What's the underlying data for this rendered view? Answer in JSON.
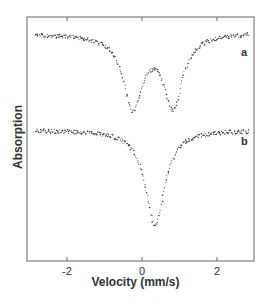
{
  "chart_data": {
    "type": "scatter",
    "title": "",
    "xlabel": "Velocity (mm/s)",
    "ylabel": "Absorption",
    "xlim": [
      -2.9,
      2.9
    ],
    "x_ticks": [
      -2,
      0,
      2
    ],
    "x_tick_labels": [
      "-2",
      "0",
      "2"
    ],
    "grid": false,
    "legend": "inline labels at right",
    "series": [
      {
        "name": "a",
        "description": "Quadrupole doublet",
        "baseline_relative": 1.0,
        "minima": [
          {
            "velocity": -0.24,
            "relative_depth": 0.86
          },
          {
            "velocity": 0.83,
            "relative_depth": 0.84
          }
        ],
        "local_maximum": {
          "velocity": 0.27,
          "relative_depth": 0.44
        }
      },
      {
        "name": "b",
        "description": "Single line",
        "baseline_relative": 1.0,
        "minima": [
          {
            "velocity": 0.35,
            "relative_depth": 1.0
          }
        ]
      }
    ]
  },
  "axes": {
    "xlabel": "Velocity (mm/s)",
    "ylabel": "Absorption",
    "ticks": [
      "-2",
      "0",
      "2"
    ]
  },
  "labels": {
    "a": "a",
    "b": "b"
  },
  "colors": {
    "points": "#333333",
    "frame": "#555555"
  }
}
